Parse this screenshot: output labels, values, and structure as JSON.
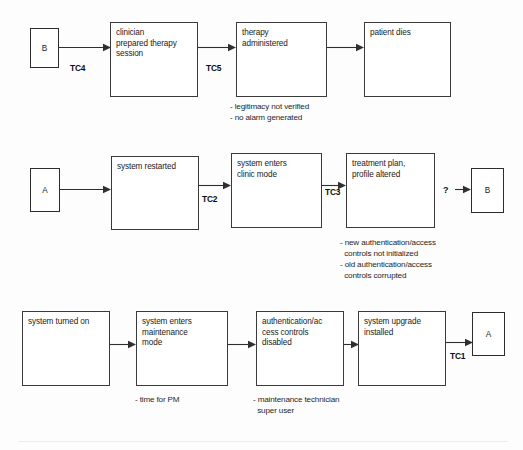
{
  "diagram": {
    "stroke_color": "#3a3a3a",
    "background_color": "#fdfdfd",
    "text_color": "#1a1a1a"
  },
  "rows": [
    {
      "id": "row-1",
      "connector_in": {
        "label": "B",
        "name": "connector-b-in"
      },
      "transitions": [
        {
          "id": "tc4",
          "label": "TC4"
        },
        {
          "id": "tc5",
          "label": "TC5"
        }
      ],
      "boxes": [
        {
          "id": "clinician-prepared-therapy-session",
          "text": "clinician\nprepared therapy\nsession"
        },
        {
          "id": "therapy-administered",
          "text": "therapy\nadministered"
        },
        {
          "id": "patient-dies",
          "text": "patient dies"
        }
      ],
      "notes": [
        {
          "id": "note-therapy-administered",
          "text": "- legitimacy not verified\n- no alarm generated"
        }
      ]
    },
    {
      "id": "row-2",
      "connector_in": {
        "label": "A",
        "name": "connector-a-in"
      },
      "connector_out": {
        "label": "B",
        "name": "connector-b-out"
      },
      "unknown_marker": "?",
      "transitions": [
        {
          "id": "tc2",
          "label": "TC2"
        },
        {
          "id": "tc3",
          "label": "TC3"
        }
      ],
      "boxes": [
        {
          "id": "system-restarted",
          "text": "system restarted"
        },
        {
          "id": "system-enters-clinic-mode",
          "text": "system enters\nclinic mode"
        },
        {
          "id": "treatment-plan-profile-altered",
          "text": "treatment plan,\nprofile altered"
        }
      ],
      "notes": [
        {
          "id": "note-treatment-plan",
          "text": "- new authentication/access\n  controls not initialized\n- old authentication/access\n  controls corrupted"
        }
      ]
    },
    {
      "id": "row-3",
      "connector_out": {
        "label": "A",
        "name": "connector-a-out"
      },
      "transitions": [
        {
          "id": "tc1",
          "label": "TC1"
        }
      ],
      "boxes": [
        {
          "id": "system-turned-on",
          "text": "system turned on"
        },
        {
          "id": "system-enters-maintenance-mode",
          "text": "system enters\nmaintenance\nmode"
        },
        {
          "id": "authentication-access-controls-disabled",
          "text": "authentication/ac\ncess controls\ndisabled"
        },
        {
          "id": "system-upgrade-installed",
          "text": "system upgrade\ninstalled"
        }
      ],
      "notes": [
        {
          "id": "note-maintenance-mode",
          "text": "- time for PM"
        },
        {
          "id": "note-access-controls",
          "text": "- maintenance technician\n  super user"
        }
      ]
    }
  ]
}
